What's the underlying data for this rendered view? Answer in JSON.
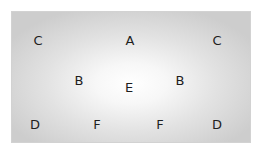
{
  "diagram": {
    "labels": [
      {
        "id": "c-top-left",
        "text": "C",
        "x": 38,
        "y": 40
      },
      {
        "id": "a-top-center",
        "text": "A",
        "x": 130,
        "y": 40
      },
      {
        "id": "c-top-right",
        "text": "C",
        "x": 217,
        "y": 40
      },
      {
        "id": "b-mid-left",
        "text": "B",
        "x": 79,
        "y": 80
      },
      {
        "id": "e-center",
        "text": "E",
        "x": 129,
        "y": 87
      },
      {
        "id": "b-mid-right",
        "text": "B",
        "x": 180,
        "y": 80
      },
      {
        "id": "d-bottom-left",
        "text": "D",
        "x": 35,
        "y": 124
      },
      {
        "id": "f-bottom-left",
        "text": "F",
        "x": 97,
        "y": 124
      },
      {
        "id": "f-bottom-right",
        "text": "F",
        "x": 160,
        "y": 124
      },
      {
        "id": "d-bottom-right",
        "text": "D",
        "x": 217,
        "y": 124
      }
    ],
    "colors": {
      "center": "#ffffff",
      "edge": "#cdcdcd",
      "text": "#1e1e1e"
    }
  }
}
